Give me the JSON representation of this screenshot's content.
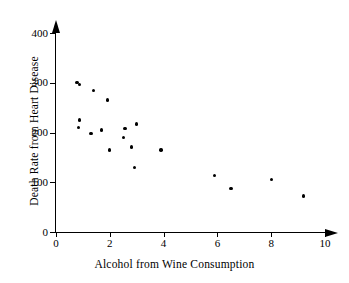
{
  "chart_data": {
    "type": "scatter",
    "title": "",
    "xlabel": "Alcohol from Wine Consumption",
    "ylabel": "Death Rate from Heart Disease",
    "xlim": [
      0,
      10
    ],
    "ylim": [
      0,
      400
    ],
    "xticks": [
      0,
      2,
      4,
      6,
      8,
      10
    ],
    "xtick_labels": [
      "0",
      "2",
      "4",
      "6",
      "8",
      "10"
    ],
    "yticks": [
      0,
      100,
      200,
      300,
      400
    ],
    "ytick_labels": [
      "0",
      "100",
      "200",
      "300",
      "400"
    ],
    "grid": false,
    "legend": null,
    "marker": "filled-circle",
    "marker_color": "#000000",
    "axis_color": "#000000",
    "points": [
      {
        "x": 0.78,
        "y": 301
      },
      {
        "x": 0.88,
        "y": 297
      },
      {
        "x": 1.4,
        "y": 285
      },
      {
        "x": 1.92,
        "y": 265
      },
      {
        "x": 0.88,
        "y": 225
      },
      {
        "x": 0.84,
        "y": 210
      },
      {
        "x": 1.3,
        "y": 198
      },
      {
        "x": 1.7,
        "y": 205
      },
      {
        "x": 2.57,
        "y": 208
      },
      {
        "x": 3.0,
        "y": 217
      },
      {
        "x": 2.5,
        "y": 190
      },
      {
        "x": 2.8,
        "y": 171
      },
      {
        "x": 1.98,
        "y": 165
      },
      {
        "x": 3.9,
        "y": 165
      },
      {
        "x": 2.92,
        "y": 130
      },
      {
        "x": 5.9,
        "y": 114
      },
      {
        "x": 6.5,
        "y": 87
      },
      {
        "x": 8.0,
        "y": 106
      },
      {
        "x": 9.2,
        "y": 72
      }
    ]
  }
}
